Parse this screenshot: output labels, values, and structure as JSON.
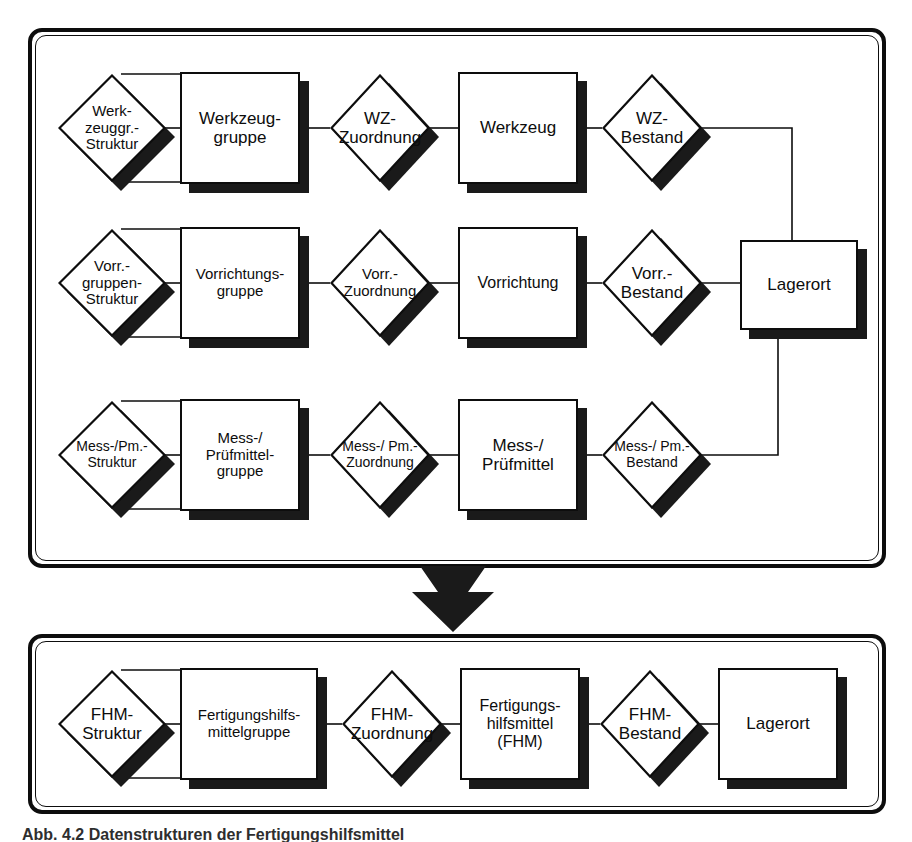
{
  "figure": {
    "caption": "Abb. 4.2 Datenstrukturen der Fertigungshilfsmittel",
    "colors": {
      "line": "#0d0d0d",
      "shadow": "#1a1a1a",
      "fill": "#ffffff",
      "arrow": "#1a1a1a"
    }
  },
  "upper_frame": {
    "name": "Einzelstrukturen",
    "rows": [
      {
        "id": "werkzeug",
        "struktur": "Werk-\nzeuggr.-\nStruktur",
        "gruppe": "Werkzeug-\ngruppe",
        "zuordnung": "WZ-\nZuordnung",
        "objekt": "Werkzeug",
        "bestand": "WZ-\nBestand"
      },
      {
        "id": "vorrichtung",
        "struktur": "Vorr.-\ngruppen-\nStruktur",
        "gruppe": "Vorrichtungs-\ngruppe",
        "zuordnung": "Vorr.-\nZuordnung",
        "objekt": "Vorrichtung",
        "bestand": "Vorr.-\nBestand"
      },
      {
        "id": "messmittel",
        "struktur": "Mess-/Pm.-\nStruktur",
        "gruppe": "Mess-/\nPrüfmittel-\ngruppe",
        "zuordnung": "Mess-/ Pm.-\nZuordnung",
        "objekt": "Mess-/\nPrüfmittel",
        "bestand": "Mess-/ Pm.-\nBestand"
      }
    ],
    "lagerort": "Lagerort"
  },
  "lower_frame": {
    "name": "Integrierte FHM-Struktur",
    "row": {
      "id": "fhm",
      "struktur": "FHM-\nStruktur",
      "gruppe": "Fertigungshilfs-\nmittelgruppe",
      "zuordnung": "FHM-\nZuordnung",
      "objekt": "Fertigungs-\nhilfsmittel\n(FHM)",
      "bestand": "FHM-\nBestand",
      "lagerort": "Lagerort"
    }
  }
}
